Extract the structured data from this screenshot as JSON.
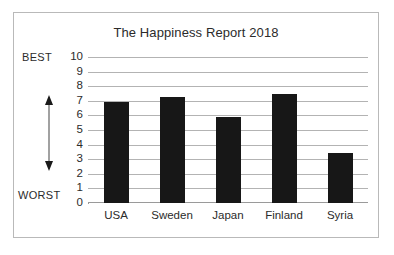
{
  "figure": {
    "frame_color": "#b9b9b9",
    "background": "#ffffff"
  },
  "chart_data": {
    "type": "bar",
    "title": "The Happiness Report 2018",
    "xlabel": "",
    "ylabel": "",
    "categories": [
      "USA",
      "Sweden",
      "Japan",
      "Finland",
      "Syria"
    ],
    "values": [
      6.9,
      7.25,
      5.9,
      7.5,
      3.4
    ],
    "ylim": [
      0,
      10
    ],
    "yticks": [
      "0",
      "1",
      "2",
      "3",
      "4",
      "5",
      "6",
      "7",
      "8",
      "9",
      "10"
    ],
    "grid": true,
    "legend": null,
    "bar_color": "#171717",
    "gridline_color": "#b3b3b3",
    "annotations": {
      "axis_top_label": "BEST",
      "axis_bottom_label": "WORST",
      "axis_arrow": "double-headed-vertical-arrow"
    }
  }
}
